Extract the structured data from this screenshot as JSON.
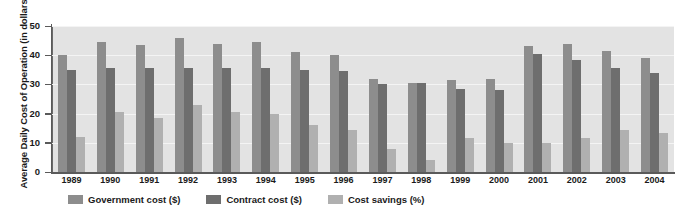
{
  "chart_data": {
    "type": "bar",
    "title": "",
    "xlabel": "",
    "ylabel": "Average Daily Cost of Operation (in dollars)",
    "ylim": [
      0,
      50
    ],
    "yticks": [
      0,
      10,
      20,
      30,
      40,
      50
    ],
    "grid": true,
    "legend_position": "bottom-left",
    "categories": [
      "1989",
      "1990",
      "1991",
      "1992",
      "1993",
      "1994",
      "1995",
      "1996",
      "1997",
      "1998",
      "1999",
      "2000",
      "2001",
      "2002",
      "2003",
      "2004"
    ],
    "series": [
      {
        "name": "Government cost ($)",
        "color": "#8d8d8d",
        "values": [
          40,
          44.5,
          43.5,
          46,
          44,
          44.5,
          41,
          40,
          32,
          30.5,
          31.5,
          32,
          43,
          44,
          41.5,
          39
        ]
      },
      {
        "name": "Contract cost ($)",
        "color": "#6e6e6e",
        "values": [
          35,
          35.5,
          35.5,
          35.5,
          35.5,
          35.5,
          35,
          34.5,
          30,
          30.5,
          28.5,
          28,
          40.5,
          38.5,
          35.5,
          34
        ]
      },
      {
        "name": "Cost savings (%)",
        "color": "#b0b0b0",
        "values": [
          12,
          20.5,
          18.5,
          23,
          20.5,
          20,
          16,
          14.5,
          8,
          4,
          11.5,
          10,
          10,
          11.5,
          14.5,
          13.5
        ]
      }
    ]
  },
  "legend": {
    "items": [
      {
        "label": "Government cost ($)",
        "swatch": "#8d8d8d"
      },
      {
        "label": "Contract cost ($)",
        "swatch": "#6e6e6e"
      },
      {
        "label": "Cost savings (%)",
        "swatch": "#b0b0b0"
      }
    ]
  }
}
